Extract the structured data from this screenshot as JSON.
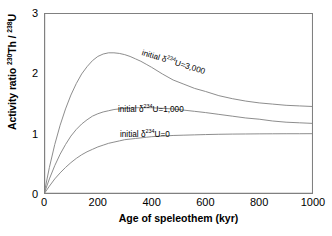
{
  "chart_data": {
    "type": "line",
    "title": "",
    "xlabel": "Age of speleothem (kyr)",
    "ylabel": "Activity ratio 230Th / 238U",
    "ylabel_parts": {
      "prefix": "Activity ratio ",
      "sup1": "230",
      "mid": "Th / ",
      "sup2": "238",
      "suffix": "U"
    },
    "xlim": [
      0,
      1000
    ],
    "ylim": [
      0,
      3
    ],
    "xticks": [
      0,
      200,
      400,
      600,
      800,
      1000
    ],
    "xtick_labels": [
      "0",
      "200",
      "400",
      "600",
      "800",
      "1000"
    ],
    "yticks": [
      0,
      1,
      2,
      3
    ],
    "ytick_labels": [
      "0",
      "1",
      "2",
      "3"
    ],
    "grid": false,
    "legend": "none",
    "line_color": "#808080",
    "axis_color": "#808080",
    "text_color": "#000000",
    "series": [
      {
        "name": "initial d234U=3,000",
        "label_prefix": "initial ",
        "label_delta": "δ",
        "label_sup": "234",
        "label_suffix": "U=3,000",
        "initial_d234U": 3000,
        "peak_x": 270,
        "peak_y": 2.33,
        "x": [
          0,
          20,
          40,
          60,
          80,
          100,
          120,
          140,
          160,
          180,
          200,
          220,
          240,
          260,
          280,
          300,
          320,
          340,
          360,
          380,
          400,
          440,
          480,
          520,
          560,
          600,
          650,
          700,
          750,
          800,
          850,
          900,
          950,
          1000
        ],
        "values": [
          0,
          0.44,
          0.82,
          1.14,
          1.41,
          1.64,
          1.83,
          1.99,
          2.11,
          2.21,
          2.28,
          2.32,
          2.34,
          2.34,
          2.33,
          2.31,
          2.28,
          2.24,
          2.2,
          2.15,
          2.1,
          1.99,
          1.89,
          1.82,
          1.75,
          1.7,
          1.63,
          1.58,
          1.54,
          1.51,
          1.49,
          1.47,
          1.46,
          1.45
        ]
      },
      {
        "name": "initial d234U=1,000",
        "label_prefix": "initial ",
        "label_delta": "δ",
        "label_sup": "234",
        "label_suffix": "U=1,000",
        "initial_d234U": 1000,
        "peak_x": 420,
        "peak_y": 1.43,
        "x": [
          0,
          20,
          40,
          60,
          80,
          100,
          120,
          140,
          160,
          180,
          200,
          220,
          240,
          260,
          280,
          300,
          320,
          340,
          360,
          380,
          400,
          440,
          480,
          520,
          560,
          600,
          650,
          700,
          750,
          800,
          850,
          900,
          950,
          1000
        ],
        "values": [
          0,
          0.25,
          0.47,
          0.66,
          0.82,
          0.96,
          1.07,
          1.16,
          1.23,
          1.29,
          1.33,
          1.36,
          1.38,
          1.4,
          1.41,
          1.42,
          1.42,
          1.43,
          1.43,
          1.43,
          1.43,
          1.42,
          1.41,
          1.39,
          1.37,
          1.35,
          1.32,
          1.29,
          1.26,
          1.24,
          1.21,
          1.19,
          1.18,
          1.17
        ]
      },
      {
        "name": "initial d234U=0",
        "label_prefix": "initial ",
        "label_delta": "δ",
        "label_sup": "234",
        "label_suffix": "U=0",
        "initial_d234U": 0,
        "peak_x": 1000,
        "peak_y": 1.0,
        "x": [
          0,
          20,
          40,
          60,
          80,
          100,
          120,
          140,
          160,
          180,
          200,
          220,
          240,
          260,
          280,
          300,
          320,
          340,
          360,
          380,
          400,
          440,
          480,
          520,
          560,
          600,
          650,
          700,
          750,
          800,
          850,
          900,
          950,
          1000
        ],
        "values": [
          0,
          0.13,
          0.25,
          0.35,
          0.44,
          0.52,
          0.59,
          0.65,
          0.7,
          0.74,
          0.78,
          0.81,
          0.84,
          0.86,
          0.88,
          0.9,
          0.91,
          0.92,
          0.93,
          0.94,
          0.95,
          0.96,
          0.97,
          0.975,
          0.98,
          0.985,
          0.99,
          0.993,
          0.995,
          0.997,
          0.998,
          0.999,
          0.999,
          1.0
        ]
      }
    ]
  }
}
